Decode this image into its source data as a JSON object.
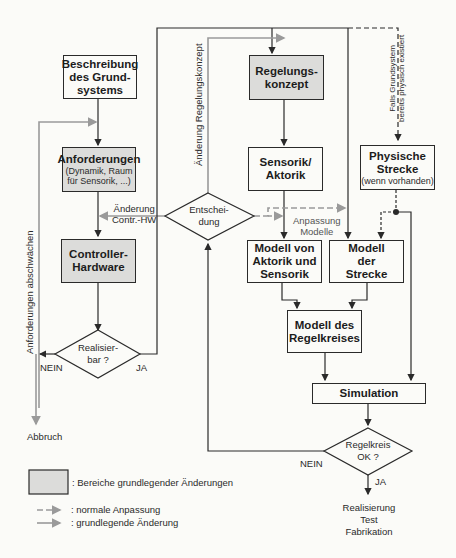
{
  "diagram": {
    "nodes": {
      "beschreibung": {
        "lines": [
          "Beschreibung",
          "des Grund-",
          "systems"
        ],
        "type": "process"
      },
      "anforderungen": {
        "title": "Anforderungen",
        "subtitle": [
          "(Dynamik, Raum",
          "für Sensorik, ...)"
        ],
        "type": "process-grey"
      },
      "controller": {
        "lines": [
          "Controller-",
          "Hardware"
        ],
        "type": "process-grey"
      },
      "realisierbar": {
        "lines": [
          "Realisier-",
          "bar ?"
        ],
        "type": "decision"
      },
      "regelungskonzept": {
        "lines": [
          "Regelungs-",
          "konzept"
        ],
        "type": "process-grey"
      },
      "sensorik": {
        "lines": [
          "Sensorik/",
          "Aktorik"
        ],
        "type": "process"
      },
      "entscheidung": {
        "lines": [
          "Entschei-",
          "dung"
        ],
        "type": "decision"
      },
      "physische": {
        "title": [
          "Physische",
          "Strecke"
        ],
        "subtitle": "(wenn vorhanden)",
        "type": "process"
      },
      "modell_aktorik": {
        "lines": [
          "Modell von",
          "Aktorik und",
          "Sensorik"
        ],
        "type": "process"
      },
      "modell_strecke": {
        "lines": [
          "Modell",
          "der",
          "Strecke"
        ],
        "type": "process"
      },
      "modell_regelkreis": {
        "lines": [
          "Modell des",
          "Regelkreises"
        ],
        "type": "process"
      },
      "simulation": {
        "lines": [
          "Simulation"
        ],
        "type": "process"
      },
      "regelkreis_ok": {
        "lines": [
          "Regelkreis",
          "OK ?"
        ],
        "type": "decision"
      }
    },
    "edge_labels": {
      "aenderung_contr_hw": [
        "Änderung",
        "Contr.-HW"
      ],
      "anpassung_modelle": [
        "Anpassung",
        "Modelle"
      ],
      "aenderung_regelungskonzept": "Änderung Regelungskonzept",
      "anforderungen_abschwaechen": "Anforderungen abschwächen",
      "falls_grundsystem": [
        "Falls Grundsystem",
        "bereits physisch existiert"
      ],
      "nein_left": "NEIN",
      "ja_left": "JA",
      "nein_bottom": "NEIN",
      "ja_bottom": "JA",
      "abbruch": "Abbruch",
      "result": [
        "Realisierung",
        "Test",
        "Fabrikation"
      ]
    },
    "legend": {
      "grey_box": ": Bereiche grundlegender Änderungen",
      "dashed": ": normale Anpassung",
      "solid": ": grundlegende Änderung"
    },
    "colors": {
      "grey_fill": "#dcdcda",
      "line": "#2a2a2a",
      "grey_line": "#9a9a9a",
      "background": "#fbfbf8"
    }
  }
}
